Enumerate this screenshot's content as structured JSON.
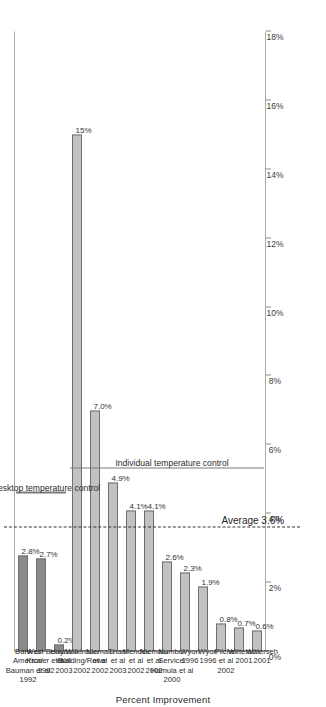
{
  "chart_data": {
    "type": "bar",
    "title": "",
    "xlabel": "",
    "ylabel": "Percent Improvement",
    "ylim": [
      0,
      18
    ],
    "grid": false,
    "orientation": "vertical-bars-rotated",
    "categories": [
      "Bank of America/ Bauman et al 1992",
      "West Bend/ Kroner et al 1992",
      "Hayashi et al 2003",
      "Wilkinson Building/Rowe 2002",
      "Niemala et al 2002",
      "Tham et al 2003",
      "Mendell et al 2002",
      "Niemala et al 2002",
      "Number Service/ Hamula et al 2000",
      "Wyon 1996",
      "Wyon 1996",
      "Pilcher et al 2002",
      "Witterseh 2001",
      "Witterseh 2001"
    ],
    "values": [
      2.8,
      2.7,
      0.2,
      15.0,
      7.0,
      4.9,
      4.1,
      4.1,
      2.6,
      2.3,
      1.9,
      0.8,
      0.7,
      0.6
    ],
    "value_labels": [
      "2.8%",
      "2.7%",
      "0.2%",
      "15%",
      "7.0%",
      "4.9%",
      "4.1%",
      "4.1%",
      "2.6%",
      "2.3%",
      "1.9%",
      "0.8%",
      "0.7%",
      "0.6%"
    ],
    "tick_labels": [
      "0%",
      "2%",
      "4%",
      "6%",
      "8%",
      "10%",
      "12%",
      "14%",
      "16%",
      "18%"
    ],
    "tick_values": [
      0,
      2,
      4,
      6,
      8,
      10,
      12,
      14,
      16,
      18
    ],
    "average": {
      "value": 3.6,
      "label": "Average 3.6%"
    },
    "groups": [
      {
        "name": "desktop",
        "label": "Desktop temperature control",
        "first": 0,
        "last": 2,
        "color": "#8a8a8a"
      },
      {
        "name": "individual",
        "label": "Individual temperature control",
        "first": 3,
        "last": 13,
        "color": "#c2c2c2"
      }
    ]
  },
  "category_lines": [
    [
      "Bank of",
      "America/",
      "Bauman et al",
      "1992"
    ],
    [
      "West Bend/",
      "Kroner et al",
      "1992"
    ],
    [
      "Hayashi",
      "et al",
      "2003"
    ],
    [
      "Wilkinson",
      "Building/Rowe",
      "2002"
    ],
    [
      "Niemala",
      "et al",
      "2002"
    ],
    [
      "Tham",
      "et al",
      "2003"
    ],
    [
      "Mendell",
      "et al",
      "2002"
    ],
    [
      "Niemala",
      "et al",
      "2002"
    ],
    [
      "Number",
      "Service/",
      "Hamula et al",
      "2000"
    ],
    [
      "Wyon",
      "1996"
    ],
    [
      "Wyon",
      "1996"
    ],
    [
      "Pilcher",
      "et al",
      "2002"
    ],
    [
      "Witterseh",
      "2001"
    ],
    [
      "Witterseh",
      "2001"
    ]
  ]
}
